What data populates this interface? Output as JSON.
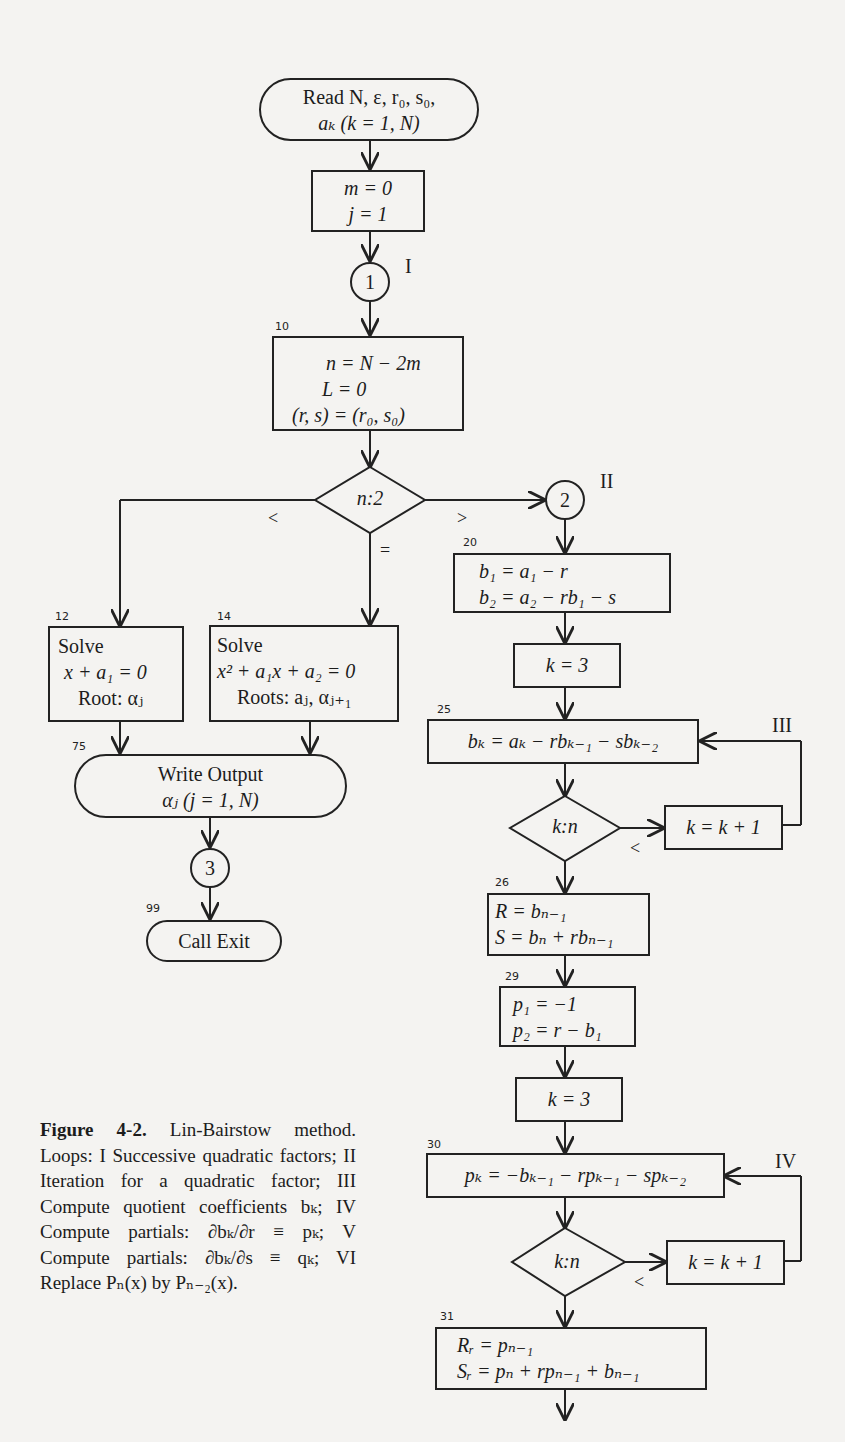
{
  "figure": {
    "nodes": {
      "start": {
        "line1": "Read N, ε, r₀, s₀,",
        "line2": "aₖ (k = 1, N)"
      },
      "init": {
        "line1": "m = 0",
        "line2": "j = 1"
      },
      "n10": {
        "num": "10",
        "line1": "n = N − 2m",
        "line2": "L = 0",
        "line3": "(r, s) = (r₀, s₀)"
      },
      "dec_n2": {
        "text": "n:2",
        "lt": "<",
        "eq": "=",
        "gt": ">"
      },
      "n12": {
        "num": "12",
        "line1": "Solve",
        "line2": "x + a₁ = 0",
        "line3": "Root: αⱼ"
      },
      "n14": {
        "num": "14",
        "line1": "Solve",
        "line2": "x² + a₁x + a₂ = 0",
        "line3": "Roots: aⱼ, αⱼ₊₁"
      },
      "n75": {
        "num": "75",
        "line1": "Write Output",
        "line2": "αⱼ (j = 1, N)"
      },
      "n99": {
        "num": "99",
        "label": "Call Exit"
      },
      "n20": {
        "num": "20",
        "line1": "b₁ = a₁ − r",
        "line2": "b₂ = a₂ − rb₁ − s"
      },
      "k3a": {
        "text": "k = 3"
      },
      "n25": {
        "num": "25",
        "text": "bₖ = aₖ − rbₖ₋₁ − sbₖ₋₂"
      },
      "dec_kn1": {
        "text": "k:n",
        "lt": "<"
      },
      "inc1": {
        "text": "k = k + 1"
      },
      "n26": {
        "num": "26",
        "line1": "R = bₙ₋₁",
        "line2": "S = bₙ + rbₙ₋₁"
      },
      "n29": {
        "num": "29",
        "line1": "p₁ = −1",
        "line2": "p₂ = r − b₁"
      },
      "k3b": {
        "text": "k = 3"
      },
      "n30": {
        "num": "30",
        "text": "pₖ = −bₖ₋₁ − rpₖ₋₁ − spₖ₋₂"
      },
      "dec_kn2": {
        "text": "k:n",
        "lt": "<"
      },
      "inc2": {
        "text": "k = k + 1"
      },
      "n31": {
        "num": "31",
        "line1": "Rᵣ = pₙ₋₁",
        "line2": "Sᵣ = pₙ + rpₙ₋₁ + bₙ₋₁"
      }
    },
    "connectors": {
      "c1": "1",
      "c2": "2",
      "c3": "3"
    },
    "loops": {
      "I": "I",
      "II": "II",
      "III": "III",
      "IV": "IV"
    },
    "caption": {
      "label": "Figure 4-2.",
      "text": " Lin-Bairstow method. Loops: I Successive quadratic factors; II Iteration for a quadratic factor; III Compute quotient coefficients bₖ; IV Compute partials: ∂bₖ/∂r ≡ pₖ; V Compute partials: ∂bₖ/∂s ≡ qₖ; VI Replace Pₙ(x) by Pₙ₋₂(x)."
    }
  }
}
